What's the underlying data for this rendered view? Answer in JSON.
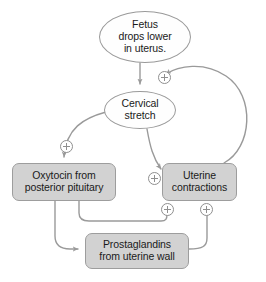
{
  "diagram": {
    "type": "flowchart",
    "background_color": "#ffffff",
    "palette": {
      "ellipse_fill": "#fefefe",
      "box_fill": "#d2d2d2",
      "node_border": "#9a9a9a",
      "edge_color": "#9a9a9a",
      "text_color": "#1a1a1a",
      "marker_color": "#8f8f8f"
    },
    "nodes": [
      {
        "id": "fetus",
        "shape": "ellipse",
        "label": "Fetus\ndrops lower\nin uterus."
      },
      {
        "id": "cervical",
        "shape": "ellipse",
        "label": "Cervical\nstretch"
      },
      {
        "id": "oxytocin",
        "shape": "box",
        "label": "Oxytocin from\nposterior pituitary"
      },
      {
        "id": "uterine",
        "shape": "box",
        "label": "Uterine\ncontractions"
      },
      {
        "id": "prostaglandins",
        "shape": "box",
        "label": "Prostaglandins\nfrom uterine wall"
      }
    ],
    "edges": [
      {
        "id": "fetus-to-cervical",
        "from": "fetus",
        "to": "cervical",
        "sign": ""
      },
      {
        "id": "cervical-to-oxytocin",
        "from": "cervical",
        "to": "oxytocin",
        "sign": "+"
      },
      {
        "id": "cervical-to-uterine",
        "from": "cervical",
        "to": "uterine",
        "sign": "+"
      },
      {
        "id": "oxytocin-to-uterine",
        "from": "oxytocin",
        "to": "uterine",
        "sign": "+"
      },
      {
        "id": "oxytocin-to-prostaglandins",
        "from": "oxytocin",
        "to": "prostaglandins",
        "sign": ""
      },
      {
        "id": "prostaglandins-to-uterine",
        "from": "prostaglandins",
        "to": "uterine",
        "sign": "+"
      },
      {
        "id": "uterine-to-cervical",
        "from": "uterine",
        "to": "cervical",
        "sign": "+"
      }
    ],
    "markers": [
      {
        "id": "plus-uterine-to-cervical",
        "symbol": "+"
      },
      {
        "id": "plus-cervical-to-oxytocin",
        "symbol": "+"
      },
      {
        "id": "plus-cervical-to-uterine",
        "symbol": "+"
      },
      {
        "id": "plus-oxytocin-to-uterine",
        "symbol": "+"
      },
      {
        "id": "plus-prosta-to-uterine",
        "symbol": "+"
      }
    ]
  }
}
